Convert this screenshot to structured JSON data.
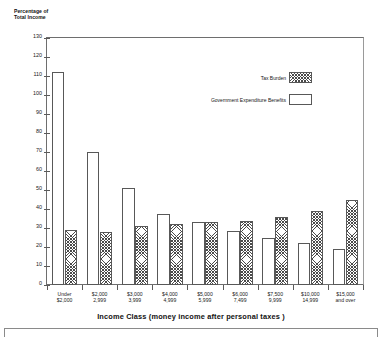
{
  "chart_data": {
    "type": "bar",
    "title": "",
    "xlabel": "Income Class (money income after personal taxes )",
    "ylabel": "Percentage of\nTotal Income",
    "ylim": [
      0,
      130
    ],
    "ytick_step": 10,
    "grid": false,
    "legend_position": "upper-right-inside",
    "categories": [
      "Under\n$2,000",
      "$2,000\n2,999",
      "$3,000\n3,999",
      "$4,000\n4,999",
      "$5,000\n5,999",
      "$6,000\n7,499",
      "$7,500\n9,999",
      "$10,000\n14,999",
      "$15,000\nand over"
    ],
    "yticks": [
      0,
      10,
      20,
      30,
      40,
      50,
      60,
      70,
      80,
      90,
      100,
      110,
      120,
      130
    ],
    "series": [
      {
        "name": "Government Expenditure Benefits",
        "fill": "white",
        "values": [
          112,
          70,
          51,
          37.5,
          33,
          28.5,
          25,
          22,
          19
        ]
      },
      {
        "name": "Tax Burden",
        "fill": "hatched",
        "values": [
          29,
          28,
          31,
          32,
          33,
          33.5,
          36,
          39,
          45
        ]
      }
    ]
  },
  "legend": {
    "items": [
      {
        "label": "Tax Burden",
        "swatch": "hatched"
      },
      {
        "label": "Government Expenditure Benefits",
        "swatch": "white"
      }
    ]
  }
}
